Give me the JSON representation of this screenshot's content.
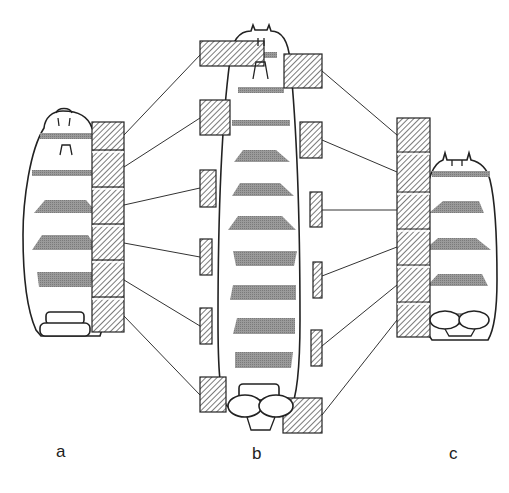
{
  "figure": {
    "labels": [
      {
        "id": "a",
        "text": "a",
        "x": 56,
        "y": 458
      },
      {
        "id": "b",
        "text": "b",
        "x": 252,
        "y": 461
      },
      {
        "id": "c",
        "text": "c",
        "x": 449,
        "y": 461
      }
    ],
    "colors": {
      "line": "#222222",
      "band": "#8c8c8c",
      "background": "#ffffff"
    },
    "bodies": [
      {
        "id": "a",
        "outline": "M63,111 C52,111 45,118 44,128 C30,150 23,200 23,235 C23,280 27,310 36,330 L41,336 L100,336 C106,320 108,280 108,235 C108,190 103,145 92,128 C88,116 78,111 63,111 Z",
        "bands": [
          {
            "type": "bar",
            "x": 40,
            "y": 133,
            "w": 56,
            "h": 6
          },
          {
            "type": "bar",
            "x": 32,
            "y": 170,
            "w": 68,
            "h": 6
          },
          {
            "type": "trap",
            "points": "45,200 86,200 97,213 34,213"
          },
          {
            "type": "trap",
            "points": "42,235 88,235 98,250 32,250"
          },
          {
            "type": "trap",
            "points": "37,272 93,272 91,287 39,287"
          }
        ],
        "column": {
          "x": 92,
          "y": 122,
          "w": 32,
          "h": 210,
          "divisions": [
            150,
            187,
            224,
            260,
            297
          ]
        }
      },
      {
        "id": "b",
        "outline": "M255,30 L253,25 L251,31 C240,31 232,40 230,60 C222,120 218,220 218,320 C218,370 220,395 226,405 L232,410 L290,410 C296,400 300,370 300,320 C300,220 296,120 290,60 C288,40 282,31 271,31 L269,25 L267,30 Z",
        "bands": [
          {
            "type": "bar",
            "x": 245,
            "y": 52,
            "w": 32,
            "h": 6
          },
          {
            "type": "bar",
            "x": 238,
            "y": 87,
            "w": 46,
            "h": 6
          },
          {
            "type": "bar",
            "x": 232,
            "y": 120,
            "w": 58,
            "h": 6
          },
          {
            "type": "trap",
            "points": "243,150 276,150 290,162 234,162"
          },
          {
            "type": "trap",
            "points": "240,183 280,183 294,196 232,196"
          },
          {
            "type": "trap",
            "points": "238,216 282,216 296,230 228,230"
          },
          {
            "type": "trap",
            "points": "233,251 297,251 294,266 236,266"
          },
          {
            "type": "trap",
            "points": "233,285 296,285 296,300 230,300"
          },
          {
            "type": "trap",
            "points": "237,318 295,318 295,334 233,334"
          },
          {
            "type": "trap",
            "points": "235,352 293,352 291,368 235,368"
          }
        ],
        "left_rects": [
          {
            "x": 200,
            "y": 41,
            "w": 64,
            "h": 25
          },
          {
            "x": 200,
            "y": 100,
            "w": 30,
            "h": 35
          },
          {
            "x": 200,
            "y": 170,
            "w": 16,
            "h": 37
          },
          {
            "x": 200,
            "y": 239,
            "w": 12,
            "h": 36
          },
          {
            "x": 200,
            "y": 308,
            "w": 12,
            "h": 36
          },
          {
            "x": 200,
            "y": 377,
            "w": 26,
            "h": 35
          }
        ],
        "right_rects": [
          {
            "x": 284,
            "y": 54,
            "w": 38,
            "h": 34
          },
          {
            "x": 300,
            "y": 122,
            "w": 22,
            "h": 36
          },
          {
            "x": 310,
            "y": 192,
            "w": 12,
            "h": 35
          },
          {
            "x": 313,
            "y": 262,
            "w": 9,
            "h": 36
          },
          {
            "x": 311,
            "y": 330,
            "w": 11,
            "h": 36
          },
          {
            "x": 283,
            "y": 398,
            "w": 39,
            "h": 35
          }
        ]
      },
      {
        "id": "c",
        "outline": "M447,160 L445,153 L443,160 C432,164 428,180 425,200 C420,240 420,280 421,310 C422,325 428,335 432,340 L488,340 C494,330 497,310 497,280 C497,240 495,200 490,180 C487,168 480,162 471,160 L469,153 L467,160 Z",
        "bands": [
          {
            "type": "bar",
            "x": 432,
            "y": 171,
            "w": 58,
            "h": 6
          },
          {
            "type": "trap",
            "points": "443,201 479,201 484,213 429,213"
          },
          {
            "type": "trap",
            "points": "438,238 476,238 491,250 424,250"
          },
          {
            "type": "trap",
            "points": "438,274 482,274 488,286 427,286"
          },
          {
            "type": "trap",
            "points": "441,313 480,313 483,325 434,325"
          }
        ],
        "column": {
          "x": 397,
          "y": 118,
          "w": 33,
          "h": 219,
          "divisions": [
            152,
            192,
            229,
            265,
            302
          ]
        }
      }
    ],
    "connectors_a_to_b": [
      {
        "x1": 124,
        "y1": 135,
        "x2": 200,
        "y2": 55
      },
      {
        "x1": 124,
        "y1": 167,
        "x2": 200,
        "y2": 118
      },
      {
        "x1": 124,
        "y1": 205,
        "x2": 200,
        "y2": 188
      },
      {
        "x1": 124,
        "y1": 243,
        "x2": 200,
        "y2": 257
      },
      {
        "x1": 124,
        "y1": 280,
        "x2": 200,
        "y2": 326
      },
      {
        "x1": 124,
        "y1": 316,
        "x2": 200,
        "y2": 395
      }
    ],
    "connectors_b_to_c": [
      {
        "x1": 322,
        "y1": 71,
        "x2": 397,
        "y2": 135
      },
      {
        "x1": 322,
        "y1": 140,
        "x2": 397,
        "y2": 172
      },
      {
        "x1": 322,
        "y1": 210,
        "x2": 397,
        "y2": 210
      },
      {
        "x1": 322,
        "y1": 276,
        "x2": 397,
        "y2": 247
      },
      {
        "x1": 322,
        "y1": 346,
        "x2": 397,
        "y2": 285
      },
      {
        "x1": 322,
        "y1": 415,
        "x2": 397,
        "y2": 320
      }
    ]
  }
}
